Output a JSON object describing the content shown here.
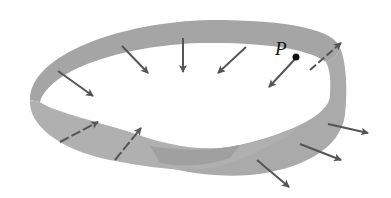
{
  "figure": {
    "point_label": "P",
    "colors": {
      "strip": "#a9a9a9",
      "strip_dark": "#9a9a9a",
      "arrow": "#555555",
      "point": "#111111",
      "background": "#ffffff"
    },
    "arrow_count": 11
  }
}
